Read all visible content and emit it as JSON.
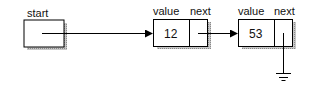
{
  "diagram": {
    "type": "linked-list",
    "head": {
      "label": "start"
    },
    "nodes": [
      {
        "value_label": "value",
        "next_label": "next",
        "value": "12",
        "next": "node-2"
      },
      {
        "value_label": "value",
        "next_label": "next",
        "value": "53",
        "next": "null"
      }
    ],
    "colors": {
      "stroke": "#000000",
      "shadow": "#9a9a9a",
      "background": "#ffffff"
    }
  }
}
